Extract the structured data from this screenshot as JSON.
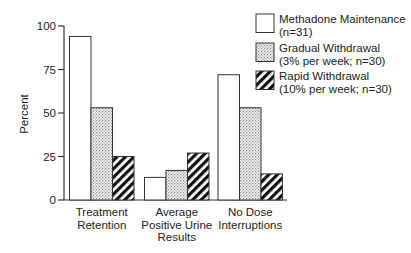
{
  "chart_data": {
    "type": "bar",
    "title": "",
    "xlabel": "",
    "ylabel": "Percent",
    "ylim": [
      0,
      100
    ],
    "yticks": [
      0,
      25,
      50,
      75,
      100
    ],
    "grid": false,
    "legend_position": "top-right",
    "categories": [
      [
        "Treatment",
        "Retention"
      ],
      [
        "Average",
        "Positive Urine",
        "Results"
      ],
      [
        "No Dose",
        "Interruptions"
      ]
    ],
    "category_names": [
      "Treatment Retention",
      "Average Positive Urine Results",
      "No Dose Interruptions"
    ],
    "series": [
      {
        "name": "Methadone Maintenance",
        "legend_lines": [
          "Methadone Maintenance",
          "(n=31)"
        ],
        "pattern": "white",
        "values": [
          94,
          13,
          72
        ]
      },
      {
        "name": "Gradual Withdrawal",
        "legend_lines": [
          "Gradual Withdrawal",
          "(3% per week; n=30)"
        ],
        "pattern": "stipple",
        "values": [
          53,
          17,
          53
        ]
      },
      {
        "name": "Rapid Withdrawal",
        "legend_lines": [
          "Rapid Withdrawal",
          "(10% per week; n=30)"
        ],
        "pattern": "hatch",
        "values": [
          25,
          27,
          15
        ]
      }
    ]
  }
}
